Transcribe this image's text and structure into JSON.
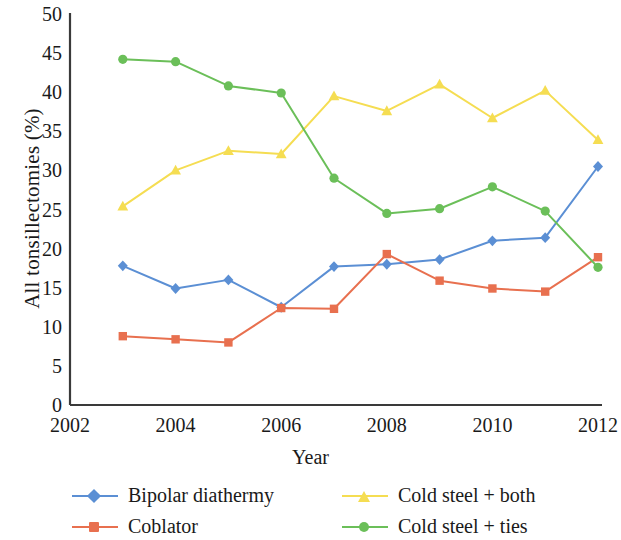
{
  "chart_data": {
    "type": "line",
    "title": "",
    "xlabel": "Year",
    "ylabel": "All tonsillectomies (%)",
    "xlim": [
      2002,
      2012
    ],
    "ylim": [
      0,
      50
    ],
    "xticks": [
      "2002",
      "2004",
      "2006",
      "2008",
      "2010",
      "2012"
    ],
    "yticks": [
      "0",
      "5",
      "10",
      "15",
      "20",
      "25",
      "30",
      "35",
      "40",
      "45",
      "50"
    ],
    "grid": false,
    "legend_position": "bottom",
    "x": [
      2003,
      2004,
      2005,
      2006,
      2007,
      2008,
      2009,
      2010,
      2011,
      2012
    ],
    "series": [
      {
        "name": "Bipolar diathermy",
        "color": "#5b8fd4",
        "marker": "diamond",
        "values": [
          17.8,
          14.9,
          16.0,
          12.5,
          17.7,
          18.0,
          18.6,
          21.0,
          21.4,
          30.5
        ]
      },
      {
        "name": "Coblator",
        "color": "#e8704f",
        "marker": "square",
        "values": [
          8.8,
          8.4,
          8.0,
          12.4,
          12.3,
          19.3,
          15.9,
          14.9,
          14.5,
          18.9
        ]
      },
      {
        "name": "Cold steel + both",
        "color": "#f5dd52",
        "marker": "triangle",
        "values": [
          25.4,
          30.0,
          32.5,
          32.1,
          39.5,
          37.6,
          41.0,
          36.7,
          40.2,
          33.9
        ]
      },
      {
        "name": "Cold steel + ties",
        "color": "#6bbf59",
        "marker": "circle",
        "values": [
          44.2,
          43.9,
          40.8,
          39.9,
          29.0,
          24.5,
          25.1,
          27.9,
          24.8,
          17.6
        ]
      }
    ]
  },
  "axis": {
    "y_title": "All tonsillectomies (%)",
    "x_title": "Year"
  },
  "legend": {
    "items": [
      {
        "label": "Bipolar diathermy"
      },
      {
        "label": "Cold steel + both"
      },
      {
        "label": "Coblator"
      },
      {
        "label": "Cold steel + ties"
      }
    ]
  }
}
